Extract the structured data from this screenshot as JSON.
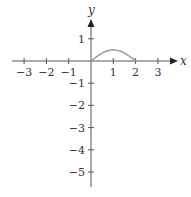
{
  "chart_data": {
    "type": "line",
    "title": "",
    "xlabel": "x",
    "ylabel": "y",
    "xlim": [
      -3.5,
      3.7
    ],
    "ylim": [
      -5.6,
      1.8
    ],
    "grid": false,
    "x_ticks": [
      -3,
      -2,
      -1,
      1,
      2,
      3
    ],
    "x_tick_labels": [
      "−3",
      "−2",
      "−1",
      "1",
      "2",
      "3"
    ],
    "y_ticks": [
      1,
      -1,
      -2,
      -3,
      -4,
      -5
    ],
    "y_tick_labels": [
      "1",
      "−1",
      "−2",
      "−3",
      "−4",
      "−5"
    ],
    "series": [
      {
        "name": "curve",
        "color": "#a0a0a0",
        "x": [
          0,
          0.25,
          0.5,
          0.75,
          1.0,
          1.25,
          1.5,
          1.75,
          2.0
        ],
        "y": [
          0,
          0.19,
          0.35,
          0.46,
          0.5,
          0.46,
          0.35,
          0.19,
          0
        ]
      }
    ]
  },
  "colors": {
    "axis": "#555555",
    "curve": "#a0a0a0"
  }
}
